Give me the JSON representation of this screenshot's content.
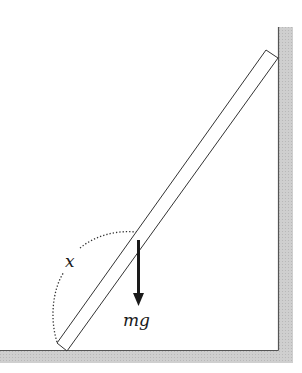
{
  "diagram": {
    "labels": {
      "angle": "x",
      "weight": "mg"
    },
    "colors": {
      "wall_fill": "#c8c8c8",
      "line": "#333333",
      "arrow": "#1a1a1a",
      "background": "#ffffff"
    },
    "elements": {
      "floor": {
        "top_y": 350,
        "thickness": 13
      },
      "wall": {
        "inner_x": 278,
        "thickness": 15,
        "top_y": 27
      },
      "ladder": {
        "bottom_corners": [
          [
            57,
            343
          ],
          [
            67,
            351
          ]
        ],
        "top_corners": [
          [
            266,
            50
          ],
          [
            278,
            58
          ]
        ]
      },
      "angle_arc": {
        "style": "dotted",
        "from": [
          57,
          342
        ],
        "to": [
          136,
          232
        ]
      },
      "weight_arrow": {
        "x": 138,
        "from_y": 240,
        "to_y": 305,
        "direction": "down"
      }
    }
  }
}
